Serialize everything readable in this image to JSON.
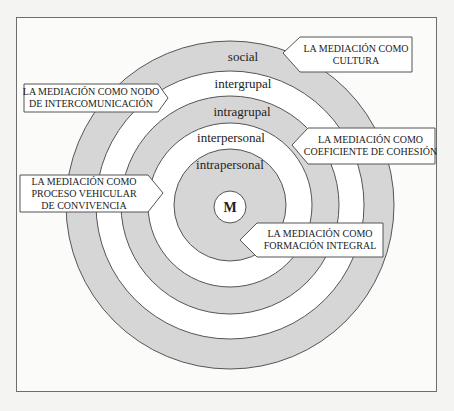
{
  "diagram": {
    "center_label": "M",
    "rings": [
      {
        "label": "social",
        "fill": "#d6d6d6"
      },
      {
        "label": "intergrupal",
        "fill": "#ffffff"
      },
      {
        "label": "intragrupal",
        "fill": "#d6d6d6"
      },
      {
        "label": "interpersonal",
        "fill": "#ffffff"
      },
      {
        "label": "intrapersonal",
        "fill": "#d6d6d6"
      }
    ],
    "callouts": [
      {
        "lines": [
          "LA MEDIACIÓN COMO",
          "CULTURA"
        ]
      },
      {
        "lines": [
          "LA MEDIACIÓN COMO NODO",
          "DE INTERCOMUNICACIÓN"
        ]
      },
      {
        "lines": [
          "LA MEDIACIÓN COMO",
          "COEFICIENTE DE COHESIÓN"
        ]
      },
      {
        "lines": [
          "LA MEDIACIÓN COMO",
          "PROCESO VEHICULAR",
          "DE CONVIVENCIA"
        ]
      },
      {
        "lines": [
          "LA MEDIACIÓN COMO",
          "FORMACIÓN INTEGRAL"
        ]
      }
    ]
  }
}
